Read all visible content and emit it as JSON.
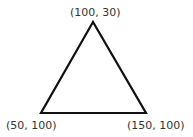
{
  "diagram": {
    "shape": "triangle",
    "stroke_color": "#111111",
    "fill_color": "none",
    "vertices": [
      {
        "label": "(100, 30)",
        "x": 100,
        "y": 30,
        "role": "apex"
      },
      {
        "label": "(50, 100)",
        "x": 50,
        "y": 100,
        "role": "bottom-left"
      },
      {
        "label": "(150, 100)",
        "x": 150,
        "y": 100,
        "role": "bottom-right"
      }
    ]
  }
}
